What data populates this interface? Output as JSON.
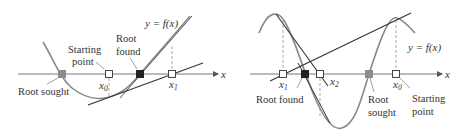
{
  "left_panel": {
    "curve_label": "y = f(x)",
    "axis_label": "x",
    "labels": {
      "root_sought": "Root sought",
      "starting_point_line1": "Starting",
      "starting_point_line2": "point",
      "root_found_line1": "Root",
      "root_found_line2": "found"
    },
    "points": {
      "x0": {
        "name": "x",
        "sub": "0"
      },
      "x1": {
        "name": "x",
        "sub": "1"
      }
    }
  },
  "right_panel": {
    "curve_label": "y = f(x)",
    "axis_label": "x",
    "labels": {
      "root_found": "Root found",
      "root_sought_line1": "Root",
      "root_sought_line2": "sought",
      "starting_point_line1": "Starting",
      "starting_point_line2": "point"
    },
    "points": {
      "x0": {
        "name": "x",
        "sub": "0"
      },
      "x1": {
        "name": "x",
        "sub": "1"
      },
      "x2": {
        "name": "x",
        "sub": "2"
      }
    }
  },
  "colors": {
    "axis": "#6b6b6b",
    "curve": "#8a8a8a",
    "tangent": "#333333",
    "root_sought_marker": "#8c8c8c",
    "root_found_marker": "#222222",
    "dashed": "#9a9a9a"
  }
}
